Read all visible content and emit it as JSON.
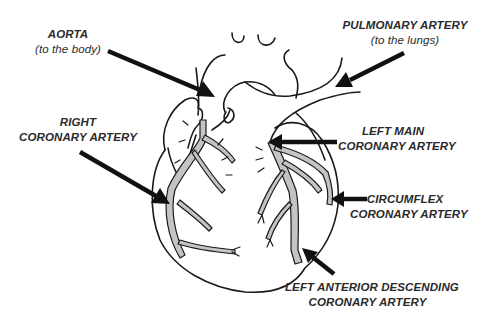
{
  "diagram": {
    "type": "anatomical-illustration",
    "colors": {
      "background": "#ffffff",
      "outline": "#1a1a1a",
      "artery_fill": "#c4c4c4",
      "arrow": "#111111",
      "label_text": "#2a2a2a"
    },
    "labels": {
      "aorta": {
        "title": "AORTA",
        "subtitle": "(to the body)"
      },
      "pulmonary": {
        "title": "PULMONARY ARTERY",
        "subtitle": "(to the lungs)"
      },
      "right_coronary": {
        "line1": "RIGHT",
        "line2": "CORONARY ARTERY"
      },
      "left_main": {
        "line1": "LEFT MAIN",
        "line2": "CORONARY ARTERY"
      },
      "circumflex": {
        "line1": "CIRCUMFLEX",
        "line2": "CORONARY ARTERY"
      },
      "lad": {
        "line1": "LEFT ANTERIOR DESCENDING",
        "line2": "CORONARY ARTERY"
      }
    }
  }
}
